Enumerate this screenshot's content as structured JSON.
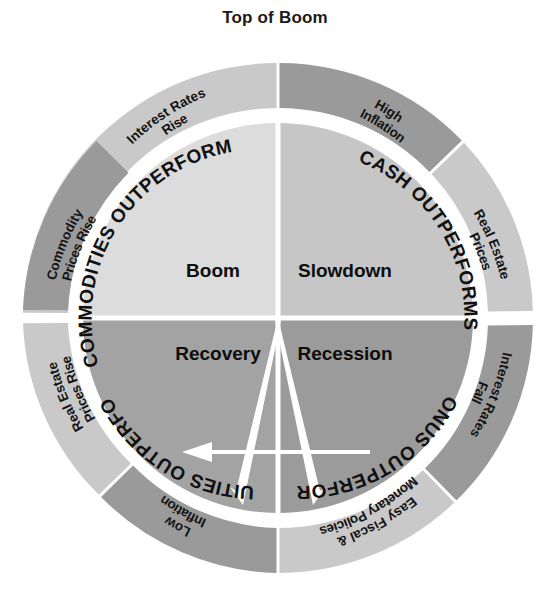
{
  "title": "Top of Boom",
  "colors": {
    "ring_light": "#c9c9c9",
    "ring_mid": "#b4b4b4",
    "ring_dark": "#9a9a9a",
    "inner_light": "#dcdcdc",
    "inner_mid": "#c6c6c6",
    "inner_dark": "#a3a3a3",
    "inner_darker": "#9b9b9b",
    "divider": "#ffffff",
    "arrow": "#ffffff",
    "text": "#101010",
    "background": "#ffffff"
  },
  "outer_ring": {
    "segments": [
      {
        "id": "interest-rates-rise",
        "lines": [
          "Interest Rates",
          "Rise"
        ],
        "shade": "light"
      },
      {
        "id": "high-inflation",
        "lines": [
          "High",
          "Inflation"
        ],
        "shade": "dark"
      },
      {
        "id": "real-estate-prices",
        "lines": [
          "Real Estate",
          "Prices"
        ],
        "shade": "light"
      },
      {
        "id": "interest-rates-fall",
        "lines": [
          "Interest Rates",
          "Fall"
        ],
        "shade": "dark"
      },
      {
        "id": "easy-fiscal-monetary",
        "lines": [
          "Easy Fiscal &",
          "Monetary Policies"
        ],
        "shade": "light"
      },
      {
        "id": "low-inflation",
        "lines": [
          "Low",
          "Inflation"
        ],
        "shade": "dark"
      },
      {
        "id": "real-estate-prices-rise",
        "lines": [
          "Real Estate",
          "Prices Rise"
        ],
        "shade": "light"
      },
      {
        "id": "commodity-prices-rise",
        "lines": [
          "Commodity",
          "Prices Rise"
        ],
        "shade": "dark"
      }
    ]
  },
  "quadrants": [
    {
      "id": "boom",
      "phase": "Boom",
      "asset_label": "COMMODITIES OUTPERFORM",
      "position": "top-left"
    },
    {
      "id": "slowdown",
      "phase": "Slowdown",
      "asset_label": "CASH OUTPERFORMS",
      "position": "top-right"
    },
    {
      "id": "recession",
      "phase": "Recession",
      "asset_label": "BONUS OUTPERFORM",
      "position": "bottom-right"
    },
    {
      "id": "recovery",
      "phase": "Recovery",
      "asset_label": "EQUITIES OUTPERFORM",
      "position": "bottom-left"
    }
  ],
  "arrows": [
    {
      "id": "arrow-down-left",
      "direction": "down-left"
    },
    {
      "id": "arrow-down-right",
      "direction": "down-right"
    },
    {
      "id": "arrow-left",
      "direction": "left"
    }
  ]
}
